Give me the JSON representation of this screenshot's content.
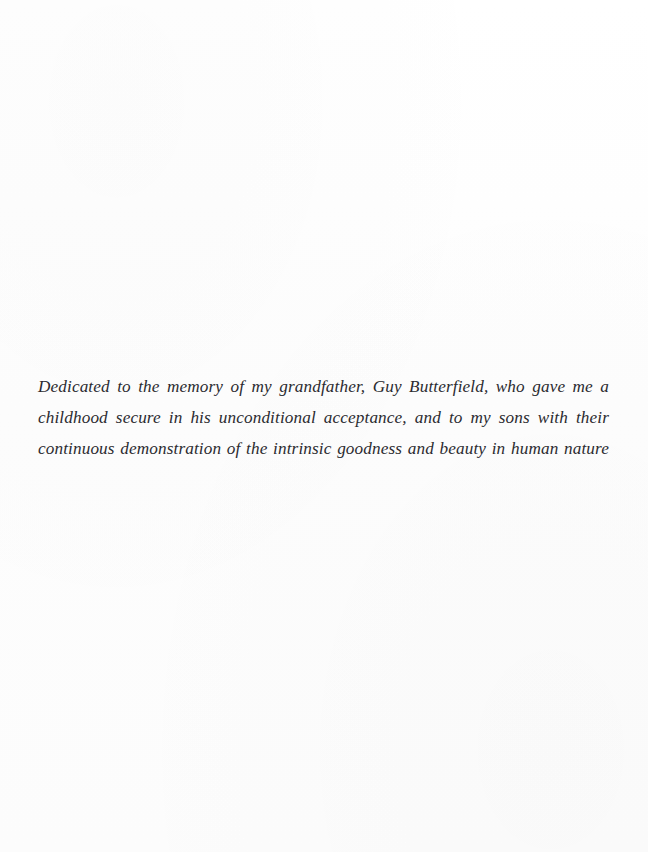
{
  "page": {
    "kind": "book-dedication-page",
    "width": 648,
    "height": 852,
    "background_color": "#fdfdfd",
    "text_color": "#2b2b30"
  },
  "dedication": {
    "full_text": "Dedicated to the memory of my grandfather, Guy Butterfield, who gave me a childhood secure in his unconditional acceptance, and to my sons with their continuous demonstration of the intrinsic goodness and beauty in human nature",
    "lines": [
      "Dedicated to the memory of my grandfather, Guy Butterfield, who gave me a",
      "childhood secure in his unconditional acceptance, and to my sons with their continuous",
      "demonstration of the intrinsic goodness and beauty in human nature"
    ],
    "alignment": "justify",
    "style": "italic-serif"
  }
}
